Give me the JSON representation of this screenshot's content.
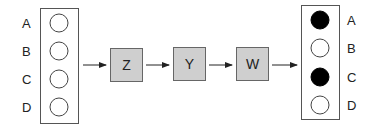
{
  "diagram": {
    "input_column": {
      "labels": [
        "A",
        "B",
        "C",
        "D"
      ],
      "states": [
        "empty",
        "empty",
        "empty",
        "empty"
      ]
    },
    "stages": [
      {
        "label": "Z",
        "fill": "#cfcfcf"
      },
      {
        "label": "Y",
        "fill": "#cfcfcf"
      },
      {
        "label": "W",
        "fill": "#cfcfcf"
      }
    ],
    "output_column": {
      "labels": [
        "A",
        "B",
        "C",
        "D"
      ],
      "states": [
        "filled",
        "empty",
        "filled",
        "empty"
      ]
    },
    "colors": {
      "stroke": "#555555",
      "filled": "#000000",
      "box_fill": "#cfcfcf",
      "arrow": "#222222"
    }
  }
}
